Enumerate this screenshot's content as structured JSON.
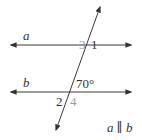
{
  "diagram": {
    "lines": [
      {
        "name": "a",
        "label": "a"
      },
      {
        "name": "b",
        "label": "b"
      }
    ],
    "angles": {
      "angle1": "1",
      "angle2": "2",
      "angle3": "3",
      "angle4": "4",
      "given": "70°"
    },
    "statement": {
      "left": "a",
      "symbol": "∥",
      "right": "b"
    },
    "colors": {
      "line": "#3a3a3a",
      "dark_label": "#333333",
      "gray_label": "#9a9a9a"
    }
  }
}
